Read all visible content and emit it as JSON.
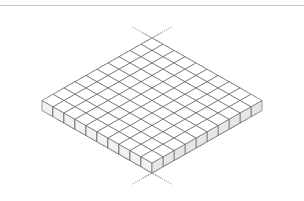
{
  "figure": {
    "grid": {
      "rows": 10,
      "cols": 10
    },
    "geometry": {
      "origin_x": 152,
      "origin_y": 38,
      "step_x": 11,
      "step_y": 6.25,
      "cube_height": 10,
      "line_length": 30
    },
    "colors": {
      "background": "#ffffff",
      "stroke": "#555555",
      "top_face": "#ffffff",
      "left_face": "#f2f2f2",
      "right_face": "#e6e6e6",
      "guide_line": "#777777",
      "rule": "#c8c8c8"
    }
  }
}
